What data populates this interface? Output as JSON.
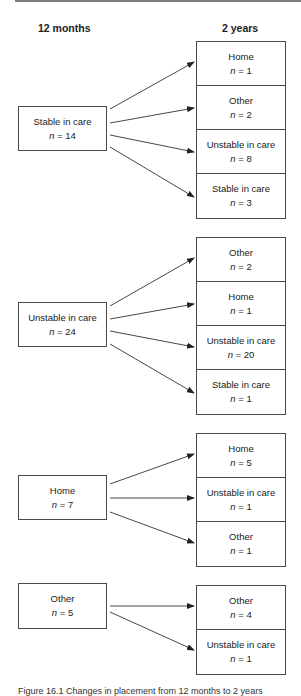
{
  "headers": {
    "left": "12 months",
    "right": "2 years"
  },
  "groups": [
    {
      "source": {
        "label": "Stable in care",
        "n": "14"
      },
      "targets": [
        {
          "label": "Home",
          "n": "1"
        },
        {
          "label": "Other",
          "n": "2"
        },
        {
          "label": "Unstable in care",
          "n": "8"
        },
        {
          "label": "Stable in care",
          "n": "3"
        }
      ]
    },
    {
      "source": {
        "label": "Unstable in care",
        "n": "24"
      },
      "targets": [
        {
          "label": "Other",
          "n": "2"
        },
        {
          "label": "Home",
          "n": "1"
        },
        {
          "label": "Unstable in care",
          "n": "20"
        },
        {
          "label": "Stable in care",
          "n": "1"
        }
      ]
    },
    {
      "source": {
        "label": "Home",
        "n": "7"
      },
      "targets": [
        {
          "label": "Home",
          "n": "5"
        },
        {
          "label": "Unstable in care",
          "n": "1"
        },
        {
          "label": "Other",
          "n": "1"
        }
      ]
    },
    {
      "source": {
        "label": "Other",
        "n": "5"
      },
      "targets": [
        {
          "label": "Other",
          "n": "4"
        },
        {
          "label": "Unstable in care",
          "n": "1"
        }
      ]
    }
  ],
  "n_prefix": "n = ",
  "caption": "Figure 16.1 Changes in placement from 12 months to 2 years"
}
